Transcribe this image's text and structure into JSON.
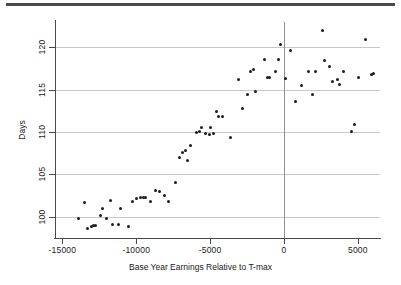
{
  "chart_data": {
    "type": "scatter",
    "title": "",
    "xlabel": "Base Year Earnings Relative to T-max",
    "ylabel": "Days",
    "xlim": [
      -15500,
      6500
    ],
    "ylim": [
      97.5,
      123
    ],
    "xticks": [
      -15000,
      -10000,
      -5000,
      0,
      5000
    ],
    "xtick_labels": [
      "-15000",
      "-10000",
      "-5000",
      "0",
      "5000"
    ],
    "yticks": [
      100,
      105,
      110,
      115,
      120
    ],
    "ytick_labels": [
      "100",
      "105",
      "110",
      "115",
      "120"
    ],
    "grid": "horizontal",
    "reference_lines": [
      {
        "axis": "x",
        "value": 0
      }
    ],
    "legend": "none",
    "marker": {
      "shape": "circle",
      "color": "#1c1c1c",
      "size": 3
    },
    "points": [
      {
        "x": -13900,
        "y": 99.8
      },
      {
        "x": -13500,
        "y": 101.7
      },
      {
        "x": -13300,
        "y": 98.6
      },
      {
        "x": -13050,
        "y": 98.9
      },
      {
        "x": -12900,
        "y": 99.0
      },
      {
        "x": -12750,
        "y": 99.0
      },
      {
        "x": -12450,
        "y": 100.1
      },
      {
        "x": -12300,
        "y": 101.0
      },
      {
        "x": -12000,
        "y": 99.8
      },
      {
        "x": -11750,
        "y": 101.9
      },
      {
        "x": -11600,
        "y": 99.1
      },
      {
        "x": -11200,
        "y": 99.1
      },
      {
        "x": -11050,
        "y": 101.0
      },
      {
        "x": -10500,
        "y": 98.8
      },
      {
        "x": -10250,
        "y": 101.8
      },
      {
        "x": -9950,
        "y": 102.2
      },
      {
        "x": -9700,
        "y": 102.3
      },
      {
        "x": -9500,
        "y": 102.3
      },
      {
        "x": -9350,
        "y": 102.3
      },
      {
        "x": -9050,
        "y": 101.8
      },
      {
        "x": -8700,
        "y": 103.1
      },
      {
        "x": -8400,
        "y": 103.0
      },
      {
        "x": -8100,
        "y": 102.5
      },
      {
        "x": -7850,
        "y": 101.8
      },
      {
        "x": -7350,
        "y": 104.0
      },
      {
        "x": -7050,
        "y": 107.0
      },
      {
        "x": -6850,
        "y": 107.6
      },
      {
        "x": -6700,
        "y": 107.8
      },
      {
        "x": -6550,
        "y": 106.6
      },
      {
        "x": -6300,
        "y": 108.4
      },
      {
        "x": -5900,
        "y": 110.0
      },
      {
        "x": -5700,
        "y": 110.1
      },
      {
        "x": -5600,
        "y": 110.5
      },
      {
        "x": -5300,
        "y": 109.8
      },
      {
        "x": -5050,
        "y": 109.7
      },
      {
        "x": -4950,
        "y": 110.5
      },
      {
        "x": -4800,
        "y": 109.8
      },
      {
        "x": -4600,
        "y": 112.4
      },
      {
        "x": -4450,
        "y": 111.8
      },
      {
        "x": -4150,
        "y": 111.8
      },
      {
        "x": -3600,
        "y": 109.4
      },
      {
        "x": -3050,
        "y": 116.2
      },
      {
        "x": -2800,
        "y": 112.8
      },
      {
        "x": -2500,
        "y": 114.4
      },
      {
        "x": -2300,
        "y": 117.1
      },
      {
        "x": -2050,
        "y": 117.4
      },
      {
        "x": -1900,
        "y": 114.8
      },
      {
        "x": -1350,
        "y": 118.6
      },
      {
        "x": -1100,
        "y": 116.4
      },
      {
        "x": -950,
        "y": 116.4
      },
      {
        "x": -550,
        "y": 117.1
      },
      {
        "x": -400,
        "y": 118.6
      },
      {
        "x": -250,
        "y": 120.3
      },
      {
        "x": 100,
        "y": 116.3
      },
      {
        "x": 450,
        "y": 119.6
      },
      {
        "x": 800,
        "y": 113.6
      },
      {
        "x": 1200,
        "y": 115.5
      },
      {
        "x": 1650,
        "y": 117.2
      },
      {
        "x": 1900,
        "y": 114.4
      },
      {
        "x": 2150,
        "y": 117.2
      },
      {
        "x": 2600,
        "y": 122.0
      },
      {
        "x": 2750,
        "y": 118.4
      },
      {
        "x": 3050,
        "y": 117.8
      },
      {
        "x": 3300,
        "y": 116.0
      },
      {
        "x": 3600,
        "y": 116.2
      },
      {
        "x": 3750,
        "y": 115.6
      },
      {
        "x": 4050,
        "y": 117.2
      },
      {
        "x": 4600,
        "y": 110.1
      },
      {
        "x": 4800,
        "y": 110.9
      },
      {
        "x": 5050,
        "y": 116.4
      },
      {
        "x": 5550,
        "y": 120.9
      },
      {
        "x": 5900,
        "y": 116.8
      },
      {
        "x": 6050,
        "y": 116.9
      }
    ]
  }
}
